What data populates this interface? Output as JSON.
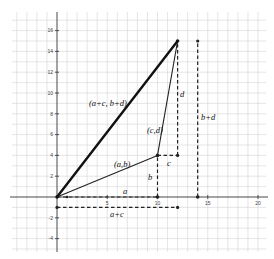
{
  "diagram": {
    "type": "vector-addition",
    "axes": {
      "x_ticks": [
        "5",
        "10",
        "15",
        "20"
      ],
      "y_ticks": [
        "16",
        "14",
        "12",
        "10",
        "8",
        "6",
        "4",
        "2",
        "-2",
        "-4"
      ]
    },
    "points": {
      "ab": {
        "x": 10,
        "y": 4,
        "label": "(a,b)"
      },
      "cd_label": "(c,d)",
      "sum": {
        "x": 12,
        "y": 15,
        "label": "(a+c, b+d)"
      }
    },
    "labels": {
      "a": "a",
      "b": "b",
      "c": "c",
      "d": "d",
      "a_plus_c": "a+c",
      "b_plus_d": "b+d"
    },
    "colors": {
      "grid": "#d4d4d4",
      "axis": "#333333",
      "vector": "#111111"
    }
  }
}
